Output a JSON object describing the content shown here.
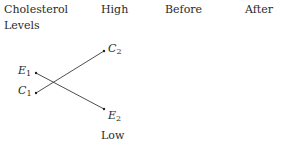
{
  "header": {
    "axis_label_line1": "Cholesterol",
    "axis_label_line2": "Levels",
    "high_label": "High",
    "before_label": "Before",
    "after_label": "After"
  },
  "low_label": "Low",
  "points": {
    "E1": {
      "letter": "E",
      "sub": "1"
    },
    "C1": {
      "letter": "C",
      "sub": "1"
    },
    "C2": {
      "letter": "C",
      "sub": "2"
    },
    "E2": {
      "letter": "E",
      "sub": "2"
    }
  },
  "lines": [
    {
      "from": "C1",
      "to": "C2"
    },
    {
      "from": "E1",
      "to": "E2"
    }
  ],
  "colors": {
    "line": "#3a3a3a",
    "text": "#2a2a2a"
  }
}
